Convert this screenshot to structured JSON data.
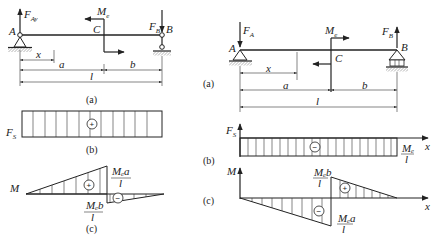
{
  "left_figure": {
    "beam": {
      "point_A": "A",
      "point_B": "B",
      "point_C": "C",
      "force_A": {
        "symbol": "F",
        "subscript": "Ay"
      },
      "force_B": {
        "symbol": "F",
        "subscript": "B"
      },
      "moment": {
        "symbol": "M",
        "subscript": "e"
      },
      "dims": {
        "x": "x",
        "a": "a",
        "b": "b",
        "l": "l"
      },
      "caption": "(a)"
    },
    "shear": {
      "axis_label": "F",
      "axis_sub": "S",
      "sign": "+",
      "caption": "(b)"
    },
    "moment_diagram": {
      "axis_label": "M",
      "pos_sign": "+",
      "neg_sign": "−",
      "label_top_num": "Mₑa",
      "label_top_den": "l",
      "label_bot_num": "Mₑb",
      "label_bot_den": "l",
      "caption": "(c)"
    }
  },
  "right_figure": {
    "beam": {
      "point_A": "A",
      "point_B": "B",
      "point_C": "C",
      "force_A": {
        "symbol": "F",
        "subscript": "A"
      },
      "force_B": {
        "symbol": "F",
        "subscript": "B"
      },
      "moment": {
        "symbol": "M",
        "subscript": "e"
      },
      "dims": {
        "x": "x",
        "a": "a",
        "b": "b",
        "l": "l"
      },
      "caption": "(a)"
    },
    "shear": {
      "axis_label": "F",
      "axis_sub": "S",
      "x_axis": "x",
      "sign": "−",
      "value_num": "Mₑ",
      "value_den": "l",
      "caption": "(b)"
    },
    "moment_diagram": {
      "axis_label": "M",
      "x_axis": "x",
      "pos_sign": "+",
      "neg_sign": "−",
      "label_top_num": "Mₑb",
      "label_top_den": "l",
      "label_bot_num": "Mₑa",
      "label_bot_den": "l",
      "caption": "(c)"
    }
  }
}
